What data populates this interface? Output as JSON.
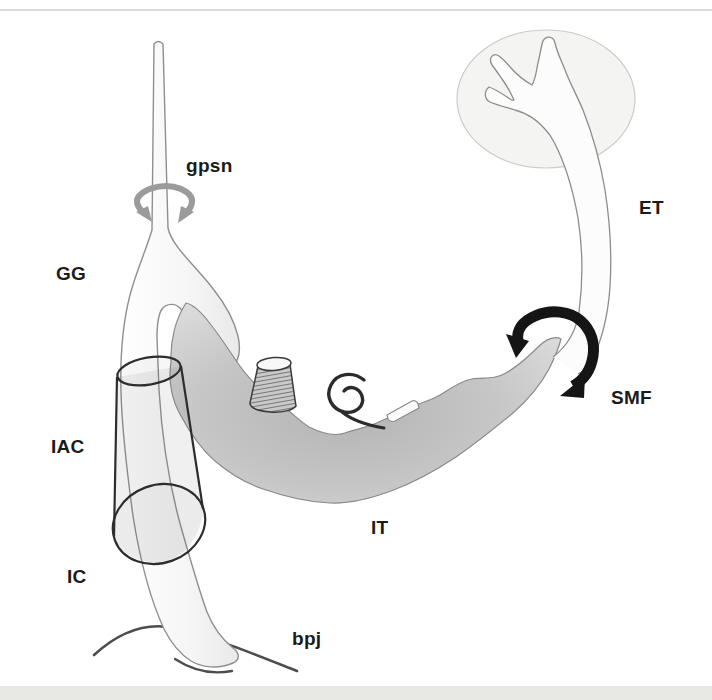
{
  "figure": {
    "labels": {
      "gpsn": "gpsn",
      "gg": "GG",
      "iac": "IAC",
      "ic": "IC",
      "bpj": "bpj",
      "it": "IT",
      "smf": "SMF",
      "et": "ET"
    },
    "colors": {
      "background": "#ffffff",
      "frame_line": "#d9d9d5",
      "bottom_band": "#e8e8e4",
      "nerve_fill_light": "#ffffff",
      "nerve_fill_shade": "#e9e9e9",
      "nerve_outline": "#8f8f8f",
      "intratemporal_fill_dark": "#b4b4b4",
      "intratemporal_fill_light": "#dedede",
      "halo_fill": "#f4f4f2",
      "halo_stroke": "#cbcbc8",
      "cylinder_stroke": "#2d2d2d",
      "gray_rotation_arrow": "#9b9b9b",
      "black_rotation_arrow": "#151515",
      "brainstem_line": "#4d4d4d",
      "label_color": "#1b1b1b"
    }
  }
}
